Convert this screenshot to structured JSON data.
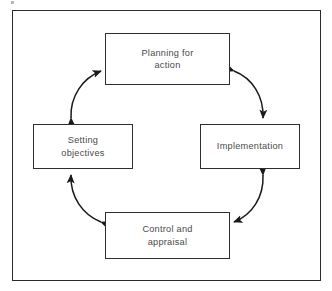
{
  "figure": {
    "type": "cycle-diagram",
    "orientation": "clockwise-bidirectional",
    "frame": {
      "border_color": "#2b2b2b",
      "background": "#ffffff"
    },
    "text_color": "#4a4a4a",
    "node_border_color": "#2e2e2e",
    "arrow_color": "#1a1a1a"
  },
  "nodes": [
    {
      "id": "planning-for-action",
      "position": "top",
      "label": "Planning for\naction",
      "line1": "Planning for",
      "line2": "action"
    },
    {
      "id": "setting-objectives",
      "position": "left",
      "label": "Setting\nobjectives",
      "line1": "Setting",
      "line2": "objectives"
    },
    {
      "id": "implementation",
      "position": "right",
      "label": "Implementation",
      "line1": "Implementation",
      "line2": ""
    },
    {
      "id": "control-and-appraisal",
      "position": "bottom",
      "label": "Control and\nappraisal",
      "line1": "Control and",
      "line2": "appraisal"
    }
  ],
  "connectors": [
    {
      "id": "objectives-planning",
      "from": "setting-objectives",
      "to": "planning-for-action",
      "style": "curved",
      "heads": "double"
    },
    {
      "id": "planning-implementation",
      "from": "planning-for-action",
      "to": "implementation",
      "style": "curved",
      "heads": "double"
    },
    {
      "id": "implementation-control",
      "from": "implementation",
      "to": "control-and-appraisal",
      "style": "curved",
      "heads": "double"
    },
    {
      "id": "control-objectives",
      "from": "control-and-appraisal",
      "to": "setting-objectives",
      "style": "curved",
      "heads": "double"
    }
  ]
}
